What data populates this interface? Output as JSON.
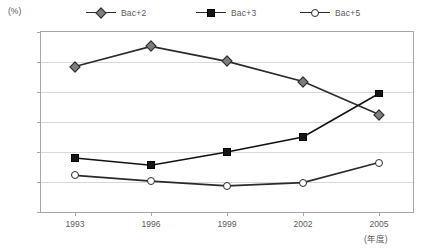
{
  "legend": {
    "position": "top",
    "items": [
      {
        "label": "Bac+2",
        "marker": "diamond-marker-icon",
        "color": "#7d7d7d"
      },
      {
        "label": "Bac+3",
        "marker": "square-marker-icon",
        "color": "#151515"
      },
      {
        "label": "Bac+5",
        "marker": "circle-marker-icon",
        "color": "#ffffff"
      }
    ]
  },
  "axes": {
    "y_unit": "(%)",
    "x_unit": "(年度)",
    "y_ticks": [
      "0",
      "10",
      "20",
      "30",
      "40",
      "50",
      "60"
    ],
    "x_ticks": [
      "1993",
      "1996",
      "1999",
      "2002",
      "2005"
    ]
  },
  "chart_data": {
    "type": "line",
    "title": "",
    "xlabel": "(年度)",
    "ylabel": "(%)",
    "categories": [
      "1993",
      "1996",
      "1999",
      "2002",
      "2005"
    ],
    "ylim": [
      0,
      60
    ],
    "xlim": [
      "1993",
      "2005"
    ],
    "grid": true,
    "legend_position": "top",
    "series": [
      {
        "name": "Bac+2",
        "marker": "diamond",
        "color": "#7d7d7d",
        "line_color": "#2b2b2b",
        "values": [
          48.5,
          55.2,
          50.2,
          43.5,
          32.5
        ]
      },
      {
        "name": "Bac+3",
        "marker": "square",
        "color": "#151515",
        "line_color": "#111111",
        "values": [
          18.0,
          15.6,
          20.0,
          25.0,
          39.5
        ]
      },
      {
        "name": "Bac+5",
        "marker": "circle",
        "color": "#ffffff",
        "line_color": "#2b2b2b",
        "values": [
          12.2,
          10.3,
          8.7,
          9.8,
          16.5
        ]
      }
    ]
  }
}
